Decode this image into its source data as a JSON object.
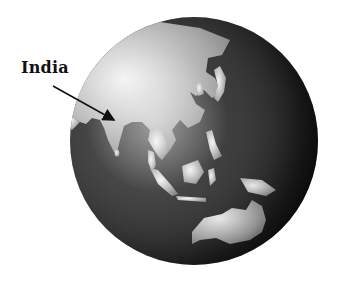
{
  "figure": {
    "type": "globe-illustration",
    "region_shown": "Asia and Oceania",
    "annotation": {
      "label": "India",
      "arrow": {
        "from": [
          53,
          86
        ],
        "to": [
          115,
          121
        ]
      }
    },
    "globe": {
      "center": [
        194,
        141
      ],
      "radius": 124,
      "colors": {
        "ocean_dark": "#111111",
        "ocean_mid": "#4a4a4a",
        "land": "#b9b9b9",
        "land_highlight": "#f2f2f2",
        "background": "#ffffff"
      }
    },
    "landmasses": [
      "Asia",
      "India",
      "Arabian Peninsula",
      "Southeast Asia",
      "Japan",
      "Philippines",
      "Indonesia",
      "New Guinea",
      "Australia"
    ]
  }
}
